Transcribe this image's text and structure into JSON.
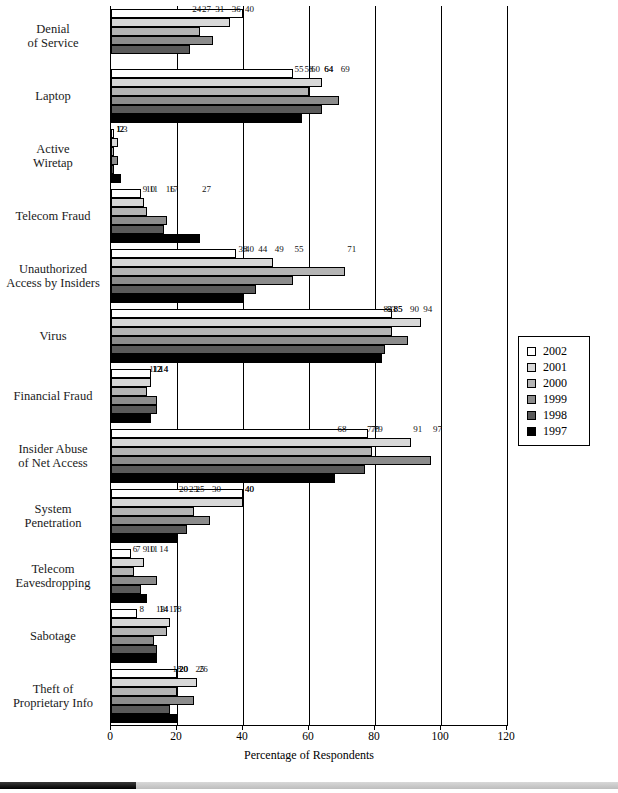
{
  "chart_data": {
    "type": "bar",
    "orientation": "horizontal",
    "title": "",
    "xlabel": "Percentage of Respondents",
    "ylabel": "",
    "xlim": [
      0,
      120
    ],
    "xticks": [
      0,
      20,
      40,
      60,
      80,
      100,
      120
    ],
    "grid": true,
    "legend_position": "right",
    "categories": [
      "Denial\nof Service",
      "Laptop",
      "Active\nWiretap",
      "Telecom Fraud",
      "Unauthorized\nAccess by Insiders",
      "Virus",
      "Financial Fraud",
      "Insider Abuse\nof Net Access",
      "System\nPenetration",
      "Telecom\nEavesdropping",
      "Sabotage",
      "Theft of\nProprietary Info"
    ],
    "series": [
      {
        "name": "2002",
        "color": "#ffffff",
        "values": [
          40,
          55,
          1,
          9,
          38,
          85,
          12,
          78,
          40,
          6,
          8,
          20
        ]
      },
      {
        "name": "2001",
        "color": "#d8d8d8",
        "values": [
          36,
          64,
          2,
          10,
          49,
          94,
          12,
          91,
          40,
          10,
          18,
          26
        ]
      },
      {
        "name": "2000",
        "color": "#b4b4b4",
        "values": [
          27,
          60,
          1,
          11,
          71,
          85,
          11,
          79,
          25,
          7,
          17,
          20
        ]
      },
      {
        "name": "1999",
        "color": "#8c8c8c",
        "values": [
          31,
          69,
          2,
          17,
          55,
          90,
          14,
          97,
          30,
          14,
          13,
          25
        ]
      },
      {
        "name": "1998",
        "color": "#5a5a5a",
        "values": [
          24,
          64,
          1,
          16,
          44,
          83,
          14,
          77,
          23,
          9,
          14,
          18
        ]
      },
      {
        "name": "1997",
        "color": "#000000",
        "values": [
          null,
          58,
          3,
          27,
          40,
          82,
          12,
          68,
          20,
          11,
          14,
          20
        ]
      }
    ]
  },
  "category_labels": [
    {
      "line1": "Denial",
      "line2": "of Service"
    },
    {
      "line1": "Laptop",
      "line2": ""
    },
    {
      "line1": "Active",
      "line2": "Wiretap"
    },
    {
      "line1": "Telecom Fraud",
      "line2": ""
    },
    {
      "line1": "Unauthorized",
      "line2": "Access by Insiders"
    },
    {
      "line1": "Virus",
      "line2": ""
    },
    {
      "line1": "Financial Fraud",
      "line2": ""
    },
    {
      "line1": "Insider Abuse",
      "line2": "of Net Access"
    },
    {
      "line1": "System",
      "line2": "Penetration"
    },
    {
      "line1": "Telecom",
      "line2": "Eavesdropping"
    },
    {
      "line1": "Sabotage",
      "line2": ""
    },
    {
      "line1": "Theft of",
      "line2": "Proprietary Info"
    }
  ],
  "axis": {
    "x_title": "Percentage of Respondents",
    "x_tick_labels": [
      "0",
      "20",
      "40",
      "60",
      "80",
      "100",
      "120"
    ]
  },
  "legend": {
    "items": [
      {
        "label": "2002",
        "color": "#ffffff"
      },
      {
        "label": "2001",
        "color": "#d8d8d8"
      },
      {
        "label": "2000",
        "color": "#b4b4b4"
      },
      {
        "label": "1999",
        "color": "#8c8c8c"
      },
      {
        "label": "1998",
        "color": "#5a5a5a"
      },
      {
        "label": "1997",
        "color": "#000000"
      }
    ]
  },
  "bottom_bar": {
    "fill_percent": 22
  }
}
